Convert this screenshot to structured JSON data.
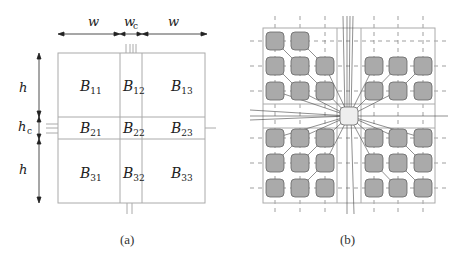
{
  "figure_a": {
    "caption": "(a)",
    "dim_labels": {
      "w_left": "w",
      "w_center": "w",
      "w_center_sub": "c",
      "w_right": "w",
      "h_top": "h",
      "h_center": "h",
      "h_center_sub": "c",
      "h_bottom": "h"
    },
    "blocks": [
      {
        "id": "B11",
        "main": "B",
        "sub": "11"
      },
      {
        "id": "B12",
        "main": "B",
        "sub": "12"
      },
      {
        "id": "B13",
        "main": "B",
        "sub": "13"
      },
      {
        "id": "B21",
        "main": "B",
        "sub": "21"
      },
      {
        "id": "B22",
        "main": "B",
        "sub": "22"
      },
      {
        "id": "B23",
        "main": "B",
        "sub": "23"
      },
      {
        "id": "B31",
        "main": "B",
        "sub": "31"
      },
      {
        "id": "B32",
        "main": "B",
        "sub": "32"
      },
      {
        "id": "B33",
        "main": "B",
        "sub": "33"
      }
    ]
  },
  "figure_b": {
    "caption": "(b)",
    "node_fill": "#aaaaaa",
    "center_node_fill": "#eeeeee"
  }
}
